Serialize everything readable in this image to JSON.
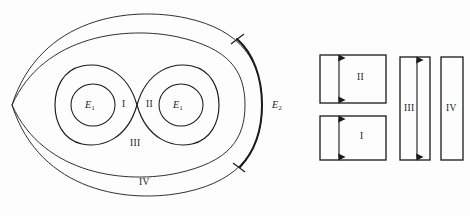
{
  "figure": {
    "type": "math-diagram",
    "background_color": "#fdfdfd",
    "stroke_color": "#1a1a1a"
  },
  "left_diagram": {
    "name": "nested-curves-diagram",
    "cusp_point": {
      "x": 12,
      "y": 105
    },
    "inner_circle_left_label": "E",
    "inner_circle_left_sub": "1",
    "inner_circle_right_label": "E",
    "inner_circle_right_sub": "1",
    "outer_arc_label": "E",
    "outer_arc_sub": "2",
    "regions": [
      {
        "id": "region-1",
        "label": "I",
        "x": 124,
        "y": 104
      },
      {
        "id": "region-2",
        "label": "II",
        "x": 150,
        "y": 104
      },
      {
        "id": "region-3",
        "label": "III",
        "x": 135,
        "y": 143
      },
      {
        "id": "region-4",
        "label": "IV",
        "x": 143,
        "y": 182
      }
    ],
    "tick_marks": [
      {
        "id": "upper-tick",
        "x": 238,
        "y": 39
      },
      {
        "id": "lower-tick",
        "x": 239,
        "y": 167
      }
    ]
  },
  "right_diagram": {
    "name": "rectangle-band-diagram",
    "rectangles": [
      {
        "id": "rect-II",
        "label": "II",
        "x": 320,
        "y": 55,
        "w": 66,
        "h": 48,
        "arrow": true,
        "arrow_x": 339,
        "label_x": 361,
        "label_y": 77
      },
      {
        "id": "rect-I",
        "label": "I",
        "x": 320,
        "y": 116,
        "w": 66,
        "h": 44,
        "arrow": true,
        "arrow_x": 339,
        "label_x": 361,
        "label_y": 136
      },
      {
        "id": "rect-III",
        "label": "III",
        "x": 400,
        "y": 57,
        "w": 30,
        "h": 103,
        "arrow": true,
        "arrow_x": 417,
        "label_x": 409,
        "label_y": 108
      },
      {
        "id": "rect-IV",
        "label": "IV",
        "x": 441,
        "y": 57,
        "w": 22,
        "h": 103,
        "arrow": false,
        "arrow_x": 0,
        "label_x": 450,
        "label_y": 108
      }
    ]
  }
}
